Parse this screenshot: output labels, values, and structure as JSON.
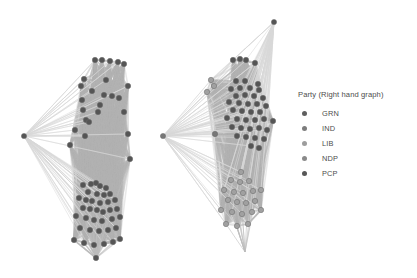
{
  "legend": {
    "title": "Party (Right hand graph)",
    "items": [
      {
        "label": "GRN",
        "color": "#5f5f5f"
      },
      {
        "label": "IND",
        "color": "#7d7d7d"
      },
      {
        "label": "LIB",
        "color": "#9d9d9d"
      },
      {
        "label": "NDP",
        "color": "#8a8a8a"
      },
      {
        "label": "PCP",
        "color": "#575757"
      }
    ]
  },
  "chart_data": {
    "type": "scatter",
    "title": "",
    "subtitle": "",
    "xlabel": "",
    "ylabel": "",
    "grid": false,
    "legend_position": "right",
    "palette": {
      "background": "#ffffff",
      "edge": "#bdbdbd",
      "edge_light": "#d8d8d8",
      "hull": "#b4b4b4",
      "node_dark": "#555555",
      "node_mid": "#777777",
      "node_light": "#a0a0a0",
      "node_stroke": "#6a6a6a"
    },
    "panels": [
      {
        "name": "left-graph",
        "uses_party_colors": false,
        "node_count": 64,
        "hub_node": {
          "x": 24,
          "y": 136,
          "shade": "node_dark"
        },
        "nodes": [
          {
            "x": 95,
            "y": 60,
            "shade": "node_dark"
          },
          {
            "x": 102,
            "y": 60,
            "shade": "node_dark"
          },
          {
            "x": 110,
            "y": 61,
            "shade": "node_dark"
          },
          {
            "x": 118,
            "y": 62,
            "shade": "node_dark"
          },
          {
            "x": 124,
            "y": 64,
            "shade": "node_dark"
          },
          {
            "x": 84,
            "y": 79,
            "shade": "node_dark"
          },
          {
            "x": 106,
            "y": 80,
            "shade": "node_dark"
          },
          {
            "x": 81,
            "y": 86,
            "shade": "node_dark"
          },
          {
            "x": 128,
            "y": 86,
            "shade": "node_dark"
          },
          {
            "x": 92,
            "y": 91,
            "shade": "node_dark"
          },
          {
            "x": 104,
            "y": 95,
            "shade": "node_dark"
          },
          {
            "x": 112,
            "y": 96,
            "shade": "node_dark"
          },
          {
            "x": 119,
            "y": 98,
            "shade": "node_dark"
          },
          {
            "x": 82,
            "y": 100,
            "shade": "node_dark"
          },
          {
            "x": 100,
            "y": 105,
            "shade": "node_dark"
          },
          {
            "x": 83,
            "y": 110,
            "shade": "node_dark"
          },
          {
            "x": 98,
            "y": 112,
            "shade": "node_dark"
          },
          {
            "x": 86,
            "y": 120,
            "shade": "node_dark"
          },
          {
            "x": 89,
            "y": 122,
            "shade": "node_dark"
          },
          {
            "x": 75,
            "y": 130,
            "shade": "node_dark"
          },
          {
            "x": 85,
            "y": 136,
            "shade": "node_dark"
          },
          {
            "x": 128,
            "y": 134,
            "shade": "node_dark"
          },
          {
            "x": 130,
            "y": 159,
            "shade": "node_dark"
          },
          {
            "x": 83,
            "y": 185,
            "shade": "node_dark"
          },
          {
            "x": 91,
            "y": 184,
            "shade": "node_dark"
          },
          {
            "x": 96,
            "y": 183,
            "shade": "node_dark"
          },
          {
            "x": 100,
            "y": 186,
            "shade": "node_dark"
          },
          {
            "x": 106,
            "y": 188,
            "shade": "node_dark"
          },
          {
            "x": 88,
            "y": 192,
            "shade": "node_dark"
          },
          {
            "x": 97,
            "y": 194,
            "shade": "node_dark"
          },
          {
            "x": 104,
            "y": 195,
            "shade": "node_dark"
          },
          {
            "x": 110,
            "y": 194,
            "shade": "node_dark"
          },
          {
            "x": 79,
            "y": 198,
            "shade": "node_dark"
          },
          {
            "x": 86,
            "y": 200,
            "shade": "node_dark"
          },
          {
            "x": 92,
            "y": 201,
            "shade": "node_dark"
          },
          {
            "x": 100,
            "y": 203,
            "shade": "node_dark"
          },
          {
            "x": 108,
            "y": 202,
            "shade": "node_dark"
          },
          {
            "x": 115,
            "y": 200,
            "shade": "node_dark"
          },
          {
            "x": 83,
            "y": 208,
            "shade": "node_dark"
          },
          {
            "x": 90,
            "y": 209,
            "shade": "node_dark"
          },
          {
            "x": 97,
            "y": 210,
            "shade": "node_dark"
          },
          {
            "x": 103,
            "y": 212,
            "shade": "node_dark"
          },
          {
            "x": 110,
            "y": 210,
            "shade": "node_dark"
          },
          {
            "x": 117,
            "y": 209,
            "shade": "node_dark"
          },
          {
            "x": 76,
            "y": 216,
            "shade": "node_dark"
          },
          {
            "x": 86,
            "y": 218,
            "shade": "node_dark"
          },
          {
            "x": 94,
            "y": 220,
            "shade": "node_dark"
          },
          {
            "x": 102,
            "y": 221,
            "shade": "node_dark"
          },
          {
            "x": 112,
            "y": 219,
            "shade": "node_dark"
          },
          {
            "x": 120,
            "y": 217,
            "shade": "node_dark"
          },
          {
            "x": 80,
            "y": 228,
            "shade": "node_dark"
          },
          {
            "x": 90,
            "y": 230,
            "shade": "node_dark"
          },
          {
            "x": 99,
            "y": 231,
            "shade": "node_dark"
          },
          {
            "x": 108,
            "y": 230,
            "shade": "node_dark"
          },
          {
            "x": 116,
            "y": 228,
            "shade": "node_dark"
          },
          {
            "x": 74,
            "y": 240,
            "shade": "node_dark"
          },
          {
            "x": 84,
            "y": 243,
            "shade": "node_dark"
          },
          {
            "x": 94,
            "y": 245,
            "shade": "node_dark"
          },
          {
            "x": 104,
            "y": 244,
            "shade": "node_dark"
          },
          {
            "x": 113,
            "y": 242,
            "shade": "node_dark"
          },
          {
            "x": 120,
            "y": 239,
            "shade": "node_dark"
          },
          {
            "x": 96,
            "y": 258,
            "shade": "node_dark"
          },
          {
            "x": 124,
            "y": 112,
            "shade": "node_dark"
          },
          {
            "x": 70,
            "y": 145,
            "shade": "node_dark"
          }
        ]
      },
      {
        "name": "right-graph",
        "uses_party_colors": true,
        "node_count": 66,
        "hub_node": {
          "x": 18,
          "y": 136,
          "shade": "node_mid"
        },
        "top_outlier": {
          "x": 129,
          "y": 22,
          "shade": "node_dark"
        },
        "nodes": [
          {
            "x": 88,
            "y": 60,
            "shade": "node_dark"
          },
          {
            "x": 95,
            "y": 59,
            "shade": "node_dark"
          },
          {
            "x": 101,
            "y": 60,
            "shade": "node_dark"
          },
          {
            "x": 110,
            "y": 63,
            "shade": "node_dark"
          },
          {
            "x": 66,
            "y": 80,
            "shade": "node_light"
          },
          {
            "x": 69,
            "y": 86,
            "shade": "node_light"
          },
          {
            "x": 91,
            "y": 81,
            "shade": "node_dark"
          },
          {
            "x": 100,
            "y": 81,
            "shade": "node_dark"
          },
          {
            "x": 113,
            "y": 84,
            "shade": "node_dark"
          },
          {
            "x": 62,
            "y": 92,
            "shade": "node_light"
          },
          {
            "x": 86,
            "y": 89,
            "shade": "node_dark"
          },
          {
            "x": 95,
            "y": 88,
            "shade": "node_dark"
          },
          {
            "x": 105,
            "y": 88,
            "shade": "node_dark"
          },
          {
            "x": 114,
            "y": 90,
            "shade": "node_dark"
          },
          {
            "x": 91,
            "y": 96,
            "shade": "node_dark"
          },
          {
            "x": 100,
            "y": 95,
            "shade": "node_dark"
          },
          {
            "x": 109,
            "y": 96,
            "shade": "node_dark"
          },
          {
            "x": 118,
            "y": 98,
            "shade": "node_dark"
          },
          {
            "x": 84,
            "y": 102,
            "shade": "node_dark"
          },
          {
            "x": 94,
            "y": 103,
            "shade": "node_dark"
          },
          {
            "x": 103,
            "y": 104,
            "shade": "node_dark"
          },
          {
            "x": 112,
            "y": 104,
            "shade": "node_dark"
          },
          {
            "x": 121,
            "y": 106,
            "shade": "node_dark"
          },
          {
            "x": 88,
            "y": 110,
            "shade": "node_dark"
          },
          {
            "x": 97,
            "y": 111,
            "shade": "node_dark"
          },
          {
            "x": 106,
            "y": 112,
            "shade": "node_dark"
          },
          {
            "x": 115,
            "y": 112,
            "shade": "node_dark"
          },
          {
            "x": 82,
            "y": 118,
            "shade": "node_dark"
          },
          {
            "x": 92,
            "y": 119,
            "shade": "node_dark"
          },
          {
            "x": 101,
            "y": 120,
            "shade": "node_dark"
          },
          {
            "x": 110,
            "y": 120,
            "shade": "node_dark"
          },
          {
            "x": 119,
            "y": 119,
            "shade": "node_dark"
          },
          {
            "x": 128,
            "y": 121,
            "shade": "node_dark"
          },
          {
            "x": 87,
            "y": 127,
            "shade": "node_dark"
          },
          {
            "x": 96,
            "y": 128,
            "shade": "node_dark"
          },
          {
            "x": 105,
            "y": 129,
            "shade": "node_dark"
          },
          {
            "x": 114,
            "y": 128,
            "shade": "node_dark"
          },
          {
            "x": 122,
            "y": 130,
            "shade": "node_dark"
          },
          {
            "x": 70,
            "y": 134,
            "shade": "node_mid"
          },
          {
            "x": 92,
            "y": 136,
            "shade": "node_dark"
          },
          {
            "x": 101,
            "y": 137,
            "shade": "node_dark"
          },
          {
            "x": 110,
            "y": 138,
            "shade": "node_dark"
          },
          {
            "x": 119,
            "y": 139,
            "shade": "node_dark"
          },
          {
            "x": 106,
            "y": 146,
            "shade": "node_dark"
          },
          {
            "x": 114,
            "y": 148,
            "shade": "node_dark"
          },
          {
            "x": 96,
            "y": 172,
            "shade": "node_light"
          },
          {
            "x": 86,
            "y": 180,
            "shade": "node_light"
          },
          {
            "x": 95,
            "y": 182,
            "shade": "node_light"
          },
          {
            "x": 104,
            "y": 181,
            "shade": "node_light"
          },
          {
            "x": 79,
            "y": 190,
            "shade": "node_light"
          },
          {
            "x": 89,
            "y": 192,
            "shade": "node_light"
          },
          {
            "x": 98,
            "y": 193,
            "shade": "node_light"
          },
          {
            "x": 108,
            "y": 191,
            "shade": "node_light"
          },
          {
            "x": 116,
            "y": 190,
            "shade": "node_light"
          },
          {
            "x": 83,
            "y": 200,
            "shade": "node_light"
          },
          {
            "x": 92,
            "y": 202,
            "shade": "node_light"
          },
          {
            "x": 101,
            "y": 203,
            "shade": "node_light"
          },
          {
            "x": 110,
            "y": 201,
            "shade": "node_light"
          },
          {
            "x": 76,
            "y": 210,
            "shade": "node_light"
          },
          {
            "x": 87,
            "y": 212,
            "shade": "node_light"
          },
          {
            "x": 97,
            "y": 214,
            "shade": "node_light"
          },
          {
            "x": 107,
            "y": 212,
            "shade": "node_light"
          },
          {
            "x": 116,
            "y": 210,
            "shade": "node_light"
          },
          {
            "x": 81,
            "y": 224,
            "shade": "node_light"
          },
          {
            "x": 92,
            "y": 226,
            "shade": "node_light"
          },
          {
            "x": 103,
            "y": 224,
            "shade": "node_light"
          }
        ]
      }
    ]
  }
}
